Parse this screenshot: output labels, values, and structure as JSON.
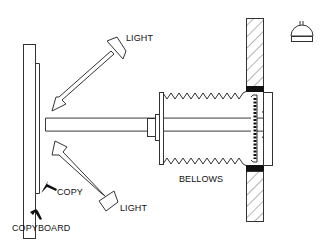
{
  "diagram": {
    "labels": {
      "light_top": "LIGHT",
      "light_bottom": "LIGHT",
      "copy": "COPY",
      "copyboard": "COPYBOARD",
      "bellows": "BELLOWS"
    },
    "components": [
      {
        "id": "copyboard",
        "name": "Copyboard"
      },
      {
        "id": "copy",
        "name": "Copy (original)"
      },
      {
        "id": "light-top",
        "name": "Upper light"
      },
      {
        "id": "light-bottom",
        "name": "Lower light"
      },
      {
        "id": "lens",
        "name": "Lens"
      },
      {
        "id": "bellows",
        "name": "Bellows"
      },
      {
        "id": "film-holder",
        "name": "Film holder"
      },
      {
        "id": "darkroom-wall",
        "name": "Darkroom wall"
      },
      {
        "id": "safelight",
        "name": "Safelight"
      }
    ],
    "icons": {
      "safelight": "dome-lamp-icon"
    },
    "colors": {
      "line": "#333333",
      "fill_dark": "#111111",
      "background": "#ffffff"
    }
  }
}
